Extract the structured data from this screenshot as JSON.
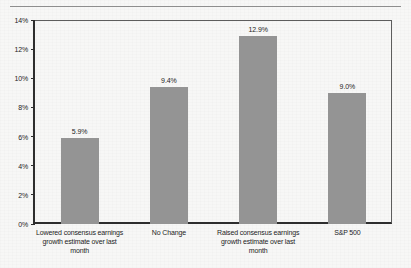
{
  "chart_data": {
    "type": "bar",
    "title": "",
    "subtitle": "",
    "xlabel": "",
    "ylabel": "",
    "categories": [
      "Lowered consensus earnings\ngrowth estimate over last month",
      "No Change",
      "Raised consensus earnings\ngrowth estimate over last month",
      "S&P 500"
    ],
    "values": [
      5.9,
      9.4,
      12.9,
      9.0
    ],
    "value_labels": [
      "5.9%",
      "9.4%",
      "12.9%",
      "9.0%"
    ],
    "ylim": [
      0,
      14
    ],
    "ytick_values": [
      0,
      2,
      4,
      6,
      8,
      10,
      12,
      14
    ],
    "ytick_labels": [
      "0%",
      "2%",
      "4%",
      "6%",
      "8%",
      "10%",
      "12%",
      "14%"
    ],
    "grid": false,
    "legend": "none",
    "bar_color": "#949494",
    "axis_color": "#2e2e2e",
    "text_color": "#1d1d1d",
    "background_color": "#f7f7f6"
  }
}
